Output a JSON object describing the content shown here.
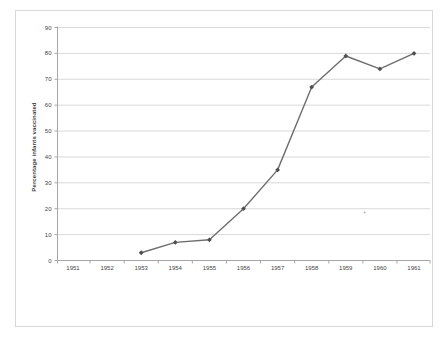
{
  "page": {
    "background": "#ffffff"
  },
  "chart": {
    "frame_border_color": "#d8d8d8",
    "colors": {
      "background": "#ffffff",
      "series_line": "#6e6e6e",
      "series_marker": "#4f4f4f",
      "gridline": "#d9d9d9",
      "axis_line": "#a6a6a6",
      "tick_label": "#3f3f3f",
      "axis_title": "#3f3f3f",
      "stray_mark": "#b3b3b3"
    }
  },
  "chart_data": {
    "type": "line",
    "title": "",
    "xlabel": "",
    "ylabel": "Percentage infants vaccinated",
    "categories": [
      "1951",
      "1952",
      "1953",
      "1954",
      "1955",
      "1956",
      "1957",
      "1958",
      "1959",
      "1960",
      "1961"
    ],
    "series": [
      {
        "name": "Percentage infants vaccinated",
        "marker": "diamond",
        "points": [
          {
            "x": "1953",
            "y": 3
          },
          {
            "x": "1954",
            "y": 7
          },
          {
            "x": "1955",
            "y": 8
          },
          {
            "x": "1956",
            "y": 20
          },
          {
            "x": "1957",
            "y": 35
          },
          {
            "x": "1958",
            "y": 67
          },
          {
            "x": "1959",
            "y": 79
          },
          {
            "x": "1960",
            "y": 74
          },
          {
            "x": "1961",
            "y": 80
          }
        ]
      }
    ],
    "ylim": [
      0,
      90
    ],
    "yticks": [
      0,
      10,
      20,
      30,
      40,
      50,
      60,
      70,
      80,
      90
    ],
    "grid": "horizontal-only",
    "legend": "none",
    "annotations": [
      {
        "kind": "stray-dot",
        "x_year": 1959.55,
        "y_value": 18.5
      }
    ]
  }
}
